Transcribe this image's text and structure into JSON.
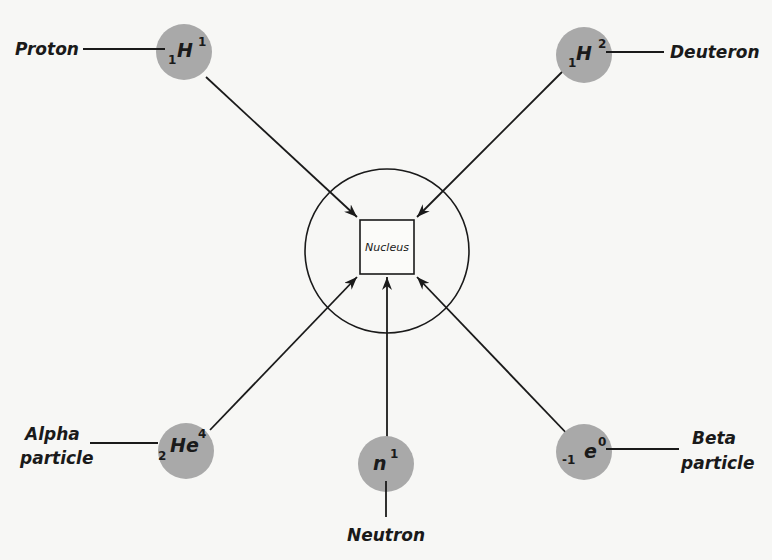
{
  "nucleus": {
    "label": "Nucleus"
  },
  "colors": {
    "particle_fill": "#a9a9a9",
    "line": "#1a1a1a",
    "background": "#f7f7f5"
  },
  "particles": [
    {
      "name": "Proton",
      "symbol": "H",
      "atomic_number": "1",
      "mass_number": "1"
    },
    {
      "name": "Deuteron",
      "symbol": "H",
      "atomic_number": "1",
      "mass_number": "2"
    },
    {
      "name_line1": "Alpha",
      "name_line2": "particle",
      "symbol": "He",
      "atomic_number": "2",
      "mass_number": "4"
    },
    {
      "name": "Neutron",
      "symbol": "n",
      "atomic_number": "",
      "mass_number": "1"
    },
    {
      "name_line1": "Beta",
      "name_line2": "particle",
      "symbol": "e",
      "atomic_number": "-1",
      "mass_number": "0"
    }
  ]
}
